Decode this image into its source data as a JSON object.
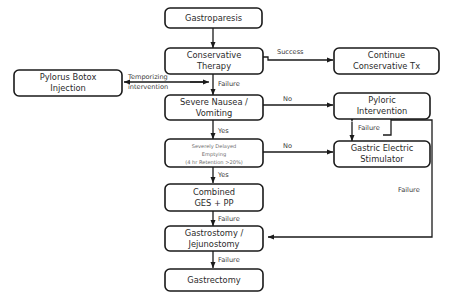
{
  "figure": {
    "caption": "Fig. 12. Decision-making algorithm for gastroparesis treatment."
  },
  "colors": {
    "box_stroke": "#1a1a1a",
    "box_fill": "#ffffff",
    "line": "#1a1a1a",
    "text": "#2b2b2b",
    "muted_text": "#6e6e6e",
    "caption": "#8d8d8d",
    "background": "#ffffff"
  },
  "nodes": {
    "gastroparesis": {
      "line1": "Gastroparesis",
      "line2": "",
      "line3": ""
    },
    "conservative_therapy": {
      "line1": "Conservative",
      "line2": "Therapy",
      "line3": ""
    },
    "continue_conservative": {
      "line1": "Continue",
      "line2": "Conservative Tx",
      "line3": ""
    },
    "pylorus_botox": {
      "line1": "Pylorus Botox",
      "line2": "Injection",
      "line3": ""
    },
    "severe_nausea": {
      "line1": "Severe Nausea /",
      "line2": "Vomiting",
      "line3": ""
    },
    "pyloric_intervention": {
      "line1": "Pyloric",
      "line2": "Intervention",
      "line3": ""
    },
    "severely_delayed": {
      "line1": "Severely Delayed",
      "line2": "Emptying",
      "line3": "(4 hr Retention >20%)"
    },
    "gastric_electric": {
      "line1": "Gastric Electric",
      "line2": "Stimulator",
      "line3": ""
    },
    "combined_ges_pp": {
      "line1": "Combined",
      "line2": "GES + PP",
      "line3": ""
    },
    "gastrostomy": {
      "line1": "Gastrostomy /",
      "line2": "Jejunostomy",
      "line3": ""
    },
    "gastrectomy": {
      "line1": "Gastrectomy",
      "line2": "",
      "line3": ""
    }
  },
  "edge_labels": {
    "success": "Success",
    "failure_conservative": "Failure",
    "temporizing_l1": "Temporizing",
    "temporizing_l2": "intervention",
    "no_nausea": "No",
    "yes_nausea": "Yes",
    "no_emptying": "No",
    "yes_emptying": "Yes",
    "failure_pyloric_ges": "Failure",
    "failure_combined": "Failure",
    "failure_right": "Failure",
    "failure_gastrostomy": "Failure"
  }
}
